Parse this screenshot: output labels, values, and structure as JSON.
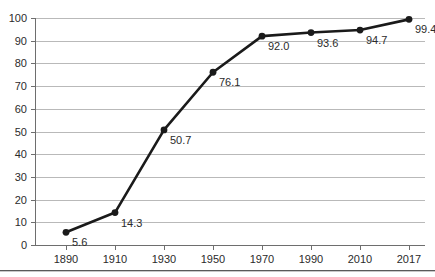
{
  "chart_data": {
    "type": "line",
    "title": "",
    "xlabel": "",
    "ylabel": "",
    "categories": [
      "1890",
      "1910",
      "1930",
      "1950",
      "1970",
      "1990",
      "2010",
      "2017"
    ],
    "values": [
      5.6,
      14.3,
      50.7,
      76.1,
      92.0,
      93.6,
      94.7,
      99.4
    ],
    "point_labels": [
      "5.6",
      "14.3",
      "50.7",
      "76.1",
      "92.0",
      "93.6",
      "94.7",
      "99.4"
    ],
    "ylim": [
      0,
      100
    ],
    "ytick_labels": [
      "0",
      "10",
      "20",
      "30",
      "40",
      "50",
      "60",
      "70",
      "80",
      "90",
      "100"
    ],
    "ytick_values": [
      0,
      10,
      20,
      30,
      40,
      50,
      60,
      70,
      80,
      90,
      100
    ],
    "grid": "horizontal",
    "legend": "none",
    "series_color": "#1a1a1a",
    "gridline_color": "#b9b9b9",
    "axis_color": "#6e6e6e",
    "label_color": "#2b2b2b"
  }
}
